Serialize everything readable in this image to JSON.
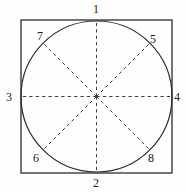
{
  "figure": {
    "background_color": "#fefefe",
    "stroke_color": "#2b2b2b",
    "dash_color": "#3a3a3a",
    "label_color": "#1a1a1a"
  },
  "square": {
    "name": "bounding-square",
    "x": 21,
    "y": 20,
    "width": 151,
    "height": 153,
    "stroke_width": 1.3
  },
  "circle": {
    "name": "inscribed-circle",
    "cx": 96.5,
    "cy": 96.5,
    "r": 75.5,
    "stroke_width": 1.2
  },
  "center": {
    "cx": 96.5,
    "cy": 96.5
  },
  "radii": [
    {
      "name": "radius-up",
      "label": "1",
      "angle_deg": 90,
      "x2": 96.5,
      "y2": 21.0
    },
    {
      "name": "radius-down",
      "label": "2",
      "angle_deg": 270,
      "x2": 96.5,
      "y2": 172.0
    },
    {
      "name": "radius-left",
      "label": "3",
      "angle_deg": 180,
      "x2": 21.0,
      "y2": 96.5
    },
    {
      "name": "radius-right",
      "label": "4",
      "angle_deg": 0,
      "x2": 172.0,
      "y2": 96.5
    },
    {
      "name": "radius-up-right",
      "label": "5",
      "angle_deg": 45,
      "x2": 149.9,
      "y2": 43.1
    },
    {
      "name": "radius-down-left",
      "label": "6",
      "angle_deg": 225,
      "x2": 43.1,
      "y2": 149.9
    },
    {
      "name": "radius-up-left",
      "label": "7",
      "angle_deg": 135,
      "x2": 43.1,
      "y2": 43.1
    },
    {
      "name": "radius-down-right",
      "label": "8",
      "angle_deg": 315,
      "x2": 149.9,
      "y2": 149.9
    }
  ],
  "labels": [
    {
      "name": "label-1",
      "text": "1",
      "left": 93,
      "top": 3
    },
    {
      "name": "label-2",
      "text": "2",
      "left": 93,
      "top": 177
    },
    {
      "name": "label-3",
      "text": "3",
      "left": 6,
      "top": 91
    },
    {
      "name": "label-4",
      "text": "4",
      "left": 174,
      "top": 91
    },
    {
      "name": "label-5",
      "text": "5",
      "left": 150,
      "top": 33
    },
    {
      "name": "label-6",
      "text": "6",
      "left": 33,
      "top": 152
    },
    {
      "name": "label-7",
      "text": "7",
      "left": 37,
      "top": 30
    },
    {
      "name": "label-8",
      "text": "8",
      "left": 148,
      "top": 152
    }
  ]
}
